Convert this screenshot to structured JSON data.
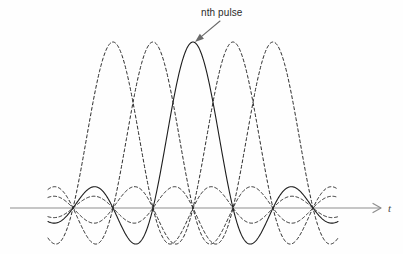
{
  "figure": {
    "background_color": "#fefefe",
    "width": 403,
    "height": 254
  },
  "annotations": {
    "pulse_label": "nth pulse",
    "axis_label_t": "t"
  },
  "colors": {
    "solid_curve": "#1d1d1d",
    "dashed_curve": "#2a2a2a",
    "axis": "#b3b3b3",
    "leader": "#6a6a6a",
    "label_text": "#2b2b2b"
  },
  "chart_data": {
    "type": "line",
    "title": "",
    "subtitle": "",
    "xlabel": "t",
    "ylabel": "",
    "grid": false,
    "legend_position": "none",
    "function": "sinc",
    "axis": {
      "baseline_y_px": 208,
      "x_start_px": 10,
      "x_end_px": 381,
      "arrow": true,
      "tick_labels": [],
      "ylim": [
        -0.27,
        1.02
      ],
      "xlim_px": [
        48,
        338
      ]
    },
    "sampling": {
      "zero_crossing_spacing_px": 40,
      "zero_crossing_positions_px": [
        48,
        88,
        128,
        168,
        208,
        248,
        288,
        328
      ],
      "peak_amplitude_px": 166,
      "first_sidelobe_ratio": -0.217,
      "second_sidelobe_ratio": 0.128
    },
    "series": [
      {
        "name": "pulse 1",
        "style": "dashed",
        "peak_x_px": 113,
        "peak_y_px": 42,
        "amplitude": 1.0,
        "is_center": false
      },
      {
        "name": "pulse 2",
        "style": "dashed",
        "peak_x_px": 153,
        "peak_y_px": 42,
        "amplitude": 1.0,
        "is_center": false
      },
      {
        "name": "nth pulse",
        "style": "solid",
        "peak_x_px": 193,
        "peak_y_px": 42,
        "amplitude": 1.0,
        "is_center": true
      },
      {
        "name": "pulse 4",
        "style": "dashed",
        "peak_x_px": 233,
        "peak_y_px": 42,
        "amplitude": 1.0,
        "is_center": false
      },
      {
        "name": "pulse 5",
        "style": "dashed",
        "peak_x_px": 273,
        "peak_y_px": 42,
        "amplitude": 1.0,
        "is_center": false
      }
    ],
    "leader": {
      "from_x_px": 220,
      "from_y_px": 21,
      "to_x_px": 195,
      "to_y_px": 42
    },
    "label_positions": {
      "pulse_label_x_px": 201,
      "pulse_label_y_px": 7,
      "axis_label_x_px": 388,
      "axis_label_y_px": 202
    }
  }
}
